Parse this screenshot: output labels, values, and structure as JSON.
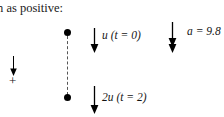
{
  "figure": {
    "caption": "n as positive:",
    "sign_convention": {
      "symbol": "+",
      "arrow_icon": "down-arrow-icon"
    },
    "points": [
      {
        "name": "start-point",
        "label": ""
      },
      {
        "name": "end-point",
        "label": ""
      }
    ],
    "vectors": [
      {
        "name": "initial-velocity",
        "label": "u (t = 0)",
        "icon": "down-arrow-icon",
        "direction": "down"
      },
      {
        "name": "final-velocity",
        "label": "2u (t = 2)",
        "icon": "down-arrow-icon",
        "direction": "down"
      },
      {
        "name": "acceleration",
        "label": "a = 9.8",
        "icon": "double-head-down-arrow-icon",
        "direction": "down"
      }
    ],
    "colors": {
      "ink": "#000000",
      "text": "#141414",
      "dashed_line": "#555555",
      "background": "#ffffff"
    }
  }
}
